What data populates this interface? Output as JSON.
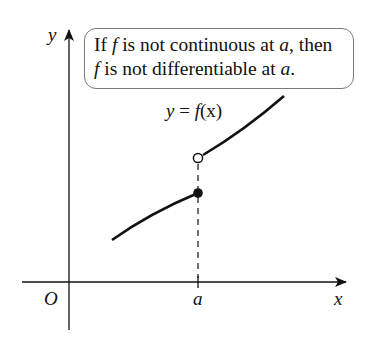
{
  "callout": {
    "line1_pre": "If ",
    "line1_f": "f",
    "line1_mid": " is not continuous at ",
    "line1_a": "a",
    "line1_post": ", then",
    "line2_f": "f",
    "line2_mid": " is not differentiable at ",
    "line2_a": "a",
    "line2_post": "."
  },
  "equation": {
    "lhs": "y",
    "eq": " = ",
    "f": "f",
    "arg": "(x)"
  },
  "axes": {
    "x_label": "x",
    "y_label": "y",
    "origin_label": "O",
    "tick_label": "a"
  },
  "colors": {
    "ink": "#111111",
    "box_border": "#7a7a7a",
    "background": "#ffffff"
  }
}
